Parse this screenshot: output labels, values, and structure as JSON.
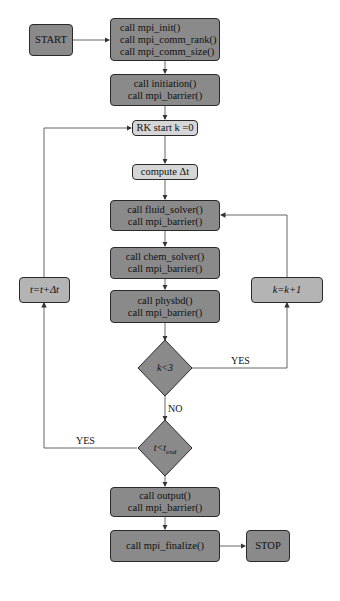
{
  "flowchart": {
    "start": "START",
    "init_block": [
      "call mpi_init()",
      "call mpi_comm_rank()",
      "call mpi_comm_size()"
    ],
    "initiation_block": [
      "call initiation()",
      "call mpi_barrier()"
    ],
    "rk_start": "RK start k =0",
    "compute_dt": "compute Δt",
    "fluid_block": [
      "call fluid_solver()",
      "call mpi_barrier()"
    ],
    "chem_block": [
      "call chem_solver()",
      "call mpi_barrier()"
    ],
    "physbd_block": [
      "call physbd()",
      "call mpi_barrier()"
    ],
    "decision_k": "k<3",
    "decision_t": {
      "main": "t<t",
      "sub": "end"
    },
    "k_increment": "k=k+1",
    "t_increment": "t=t+Δt",
    "output_block": [
      "call output()",
      "call mpi_barrier()"
    ],
    "finalize_block": "call mpi_finalize()",
    "stop": "STOP",
    "labels": {
      "yes_k": "YES",
      "no_k": "NO",
      "yes_t": "YES",
      "no_t": "NO"
    }
  },
  "colors": {
    "dark_box": "#8a8a8a",
    "light_box": "#d6d6d6",
    "mid_box": "#b4b4b4",
    "line": "#333333"
  }
}
